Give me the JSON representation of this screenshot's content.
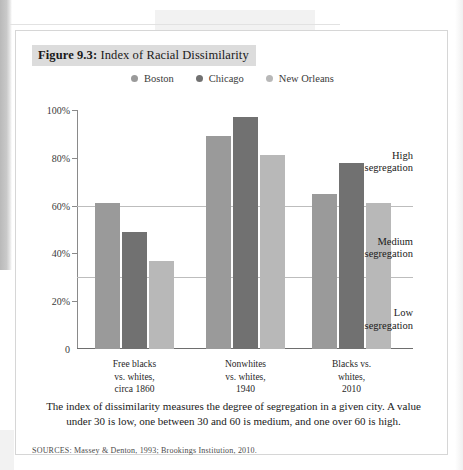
{
  "figure": {
    "number": "Figure 9.3:",
    "title": " Index of Racial Dissimilarity",
    "caption": "The index of dissimilarity measures the degree of segregation in a given city. A value under 30 is low, one between 30 and 60 is medium, and one over 60 is high.",
    "sources": "SOURCES: Massey & Denton, 1993; Brookings Institution, 2010."
  },
  "colors": {
    "boston": "#9a9a9a",
    "chicago": "#717171",
    "new_orleans": "#b8b8b8",
    "axis": "#6e6e6e",
    "reference_line": "#bdbdbd",
    "title_band": "#dcdcdc",
    "figure_border": "#d6d6d6"
  },
  "legend": {
    "items": [
      {
        "label": "Boston",
        "color_key": "boston"
      },
      {
        "label": "Chicago",
        "color_key": "chicago"
      },
      {
        "label": "New Orleans",
        "color_key": "new_orleans"
      }
    ]
  },
  "zones": [
    {
      "label_line1": "High",
      "label_line2": "segregation"
    },
    {
      "label_line1": "Medium",
      "label_line2": "segregation"
    },
    {
      "label_line1": "Low",
      "label_line2": "segregation"
    }
  ],
  "chart_data": {
    "type": "bar",
    "title": "Index of Racial Dissimilarity",
    "xlabel": "",
    "ylabel": "",
    "ylim": [
      0,
      100
    ],
    "grid": false,
    "legend_position": "top-center",
    "ytick_labels": [
      "0",
      "20%",
      "40%",
      "60%",
      "80%",
      "100%"
    ],
    "ytick_values": [
      0,
      20,
      40,
      60,
      80,
      100
    ],
    "reference_lines": [
      {
        "value": 60,
        "label": "high segregation threshold"
      },
      {
        "value": 30,
        "label": "medium segregation threshold"
      }
    ],
    "categories": [
      "Free blacks vs. whites, circa 1860",
      "Nonwhites vs. whites, 1940",
      "Blacks vs. whites, 2010"
    ],
    "category_label_lines": [
      [
        "Free blacks",
        "vs. whites,",
        "circa 1860"
      ],
      [
        "Nonwhites",
        "vs. whites,",
        "1940"
      ],
      [
        "Blacks vs.",
        "whites,",
        "2010"
      ]
    ],
    "series": [
      {
        "name": "Boston",
        "values": [
          61,
          89,
          65
        ]
      },
      {
        "name": "Chicago",
        "values": [
          49,
          97,
          78
        ]
      },
      {
        "name": "New Orleans",
        "values": [
          37,
          81,
          61
        ]
      }
    ],
    "annotations": [
      {
        "text": "High segregation",
        "y_value": 78
      },
      {
        "text": "Medium segregation",
        "y_value": 42
      },
      {
        "text": "Low segregation",
        "y_value": 12
      }
    ]
  }
}
